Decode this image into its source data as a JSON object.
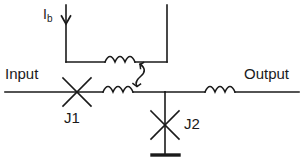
{
  "diagram": {
    "stroke_color": "#1a1a1a",
    "background_color": "#ffffff",
    "labels": {
      "input": "Input",
      "output": "Output",
      "junction_1": "J1",
      "junction_2": "J2",
      "bias_current_symbol": "I",
      "bias_current_subscript": "b"
    },
    "components": [
      {
        "name": "input-terminal-line",
        "type": "wire",
        "label": "Input"
      },
      {
        "name": "josephson-junction-j1",
        "type": "josephson-junction",
        "label": "J1"
      },
      {
        "name": "inductor-main-left",
        "type": "inductor",
        "label": ""
      },
      {
        "name": "inductor-bias-loop",
        "type": "inductor",
        "label": ""
      },
      {
        "name": "mutual-coupling",
        "type": "mutual-inductance-arrow",
        "label": ""
      },
      {
        "name": "josephson-junction-j2",
        "type": "josephson-junction",
        "label": "J2"
      },
      {
        "name": "ground",
        "type": "ground",
        "label": ""
      },
      {
        "name": "inductor-main-right",
        "type": "inductor",
        "label": ""
      },
      {
        "name": "output-terminal-line",
        "type": "wire",
        "label": "Output"
      },
      {
        "name": "bias-current-arrow",
        "type": "current-arrow",
        "label": "Ib"
      }
    ]
  }
}
